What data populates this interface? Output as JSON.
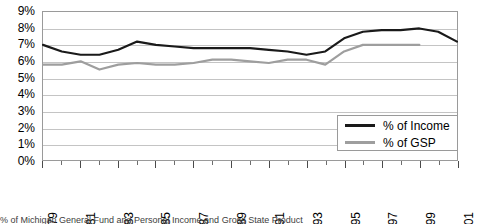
{
  "chart_data": {
    "type": "line",
    "title": "",
    "xlabel": "",
    "ylabel": "",
    "ylim": [
      0,
      9
    ],
    "xlim": [
      1979,
      2001
    ],
    "grid": true,
    "legend_position": "bottom-right",
    "y_ticks": [
      "0%",
      "1%",
      "2%",
      "3%",
      "4%",
      "5%",
      "6%",
      "7%",
      "8%",
      "9%"
    ],
    "y_tick_values": [
      0,
      1,
      2,
      3,
      4,
      5,
      6,
      7,
      8,
      9
    ],
    "x_ticks": [
      "1979",
      "1981",
      "1983",
      "1985",
      "1987",
      "1989",
      "1991",
      "1993",
      "1995",
      "1997",
      "1999",
      "2001"
    ],
    "x_tick_values": [
      1979,
      1981,
      1983,
      1985,
      1987,
      1989,
      1991,
      1993,
      1995,
      1997,
      1999,
      2001
    ],
    "x": [
      1979,
      1980,
      1981,
      1982,
      1983,
      1984,
      1985,
      1986,
      1987,
      1988,
      1989,
      1990,
      1991,
      1992,
      1993,
      1994,
      1995,
      1996,
      1997,
      1998,
      1999,
      2000,
      2001
    ],
    "series": [
      {
        "name": "% of Income",
        "color": "#1a1a1a",
        "values": [
          7.0,
          6.6,
          6.4,
          6.4,
          6.7,
          7.2,
          7.0,
          6.9,
          6.8,
          6.8,
          6.8,
          6.8,
          6.7,
          6.6,
          6.4,
          6.6,
          7.4,
          7.8,
          7.9,
          7.9,
          8.0,
          7.8,
          7.2
        ]
      },
      {
        "name": "% of GSP",
        "color": "#9e9e9e",
        "values": [
          5.8,
          5.8,
          6.0,
          5.5,
          5.8,
          5.9,
          5.8,
          5.8,
          5.9,
          6.1,
          6.1,
          6.0,
          5.9,
          6.1,
          6.1,
          5.8,
          6.6,
          7.0,
          7.0,
          7.0,
          7.0,
          null,
          null
        ]
      }
    ]
  },
  "legend": {
    "items": [
      {
        "label": "% of Income"
      },
      {
        "label": "% of GSP"
      }
    ]
  },
  "caption": {
    "text": "% of Michigan General Fund and Personal Income and Gross State Product"
  }
}
